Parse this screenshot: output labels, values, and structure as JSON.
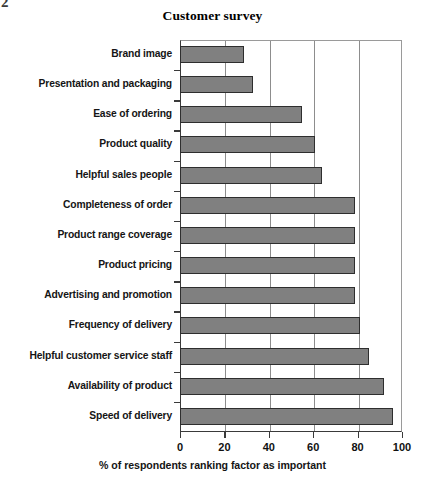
{
  "page": {
    "corner_artifact": "2"
  },
  "chart_data": {
    "type": "bar",
    "orientation": "horizontal",
    "title": "Customer survey",
    "xlabel": "% of respondents ranking factor as important",
    "ylabel": "",
    "xlim": [
      0,
      100
    ],
    "xticks": [
      0,
      20,
      40,
      60,
      80,
      100
    ],
    "xtick_labels": [
      "0",
      "20",
      "40",
      "60",
      "80",
      "100"
    ],
    "grid": "vertical",
    "legend": "none",
    "bar_color": "#808080",
    "bar_edge_color": "#2e2e2e",
    "categories": [
      "Brand image",
      "Presentation and packaging",
      "Ease of ordering",
      "Product quality",
      "Helpful sales people",
      "Completeness of order",
      "Product range coverage",
      "Product pricing",
      "Advertising and promotion",
      "Frequency of delivery",
      "Helpful customer service staff",
      "Availability of product",
      "Speed of delivery"
    ],
    "values": [
      29,
      33,
      55,
      61,
      64,
      79,
      79,
      79,
      79,
      81,
      85,
      92,
      96
    ]
  }
}
